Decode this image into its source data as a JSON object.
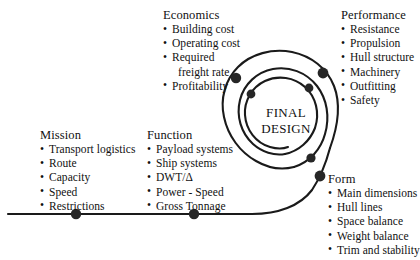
{
  "diagram": {
    "center_label_line1": "FINAL",
    "center_label_line2": "DESIGN",
    "line_color": "#1a1a1a",
    "node_color": "#262626",
    "text_color": "#111111",
    "background": "#ffffff"
  },
  "blocks": {
    "economics": {
      "title": "Economics",
      "items": [
        "Building cost",
        "Operating cost",
        "Required",
        "freight rate",
        "Profitability"
      ]
    },
    "performance": {
      "title": "Performance",
      "items": [
        "Resistance",
        "Propulsion",
        "Hull structure",
        "Machinery",
        "Outfitting",
        "Safety"
      ]
    },
    "mission": {
      "title": "Mission",
      "items": [
        "Transport logistics",
        "Route",
        "Capacity",
        "Speed",
        "Restrictions"
      ]
    },
    "function": {
      "title": "Function",
      "items": [
        "Payload systems",
        "Ship systems",
        "DWT/Δ",
        "Power - Speed",
        "Gross Tonnage"
      ]
    },
    "form": {
      "title": "Form",
      "items": [
        "Main dimensions",
        "Hull lines",
        "Space balance",
        "Weight balance",
        "Trim and stability"
      ]
    }
  },
  "nodes": [
    {
      "name": "mission-node",
      "x": 76,
      "y": 214
    },
    {
      "name": "function-node",
      "x": 194,
      "y": 214
    },
    {
      "name": "form-node",
      "x": 320,
      "y": 176
    },
    {
      "name": "economics-node",
      "x": 236,
      "y": 78
    },
    {
      "name": "performance-node",
      "x": 323,
      "y": 73
    },
    {
      "name": "inner-node-left",
      "x": 251,
      "y": 94
    },
    {
      "name": "inner-node-right",
      "x": 309,
      "y": 88
    },
    {
      "name": "inner-node-lower",
      "x": 311,
      "y": 158
    }
  ],
  "bullet_glyph": "•"
}
